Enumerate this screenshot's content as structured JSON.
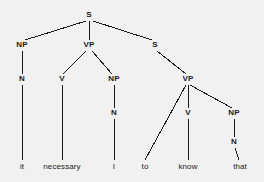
{
  "diagram": {
    "type": "constituency-tree",
    "sentence": "it necessary I to know that",
    "background_color": "#f1f1f1",
    "line_color": "#1a1a1a",
    "text_color": "#1a1a1a",
    "width": 264,
    "height": 182
  },
  "nodes": [
    {
      "id": "s-root",
      "label": "S",
      "x": 89,
      "y": 15,
      "kind": "nonterminal"
    },
    {
      "id": "np-1",
      "label": "NP",
      "x": 22,
      "y": 45,
      "kind": "nonterminal"
    },
    {
      "id": "vp-1",
      "label": "VP",
      "x": 89,
      "y": 45,
      "kind": "nonterminal"
    },
    {
      "id": "s-2",
      "label": "S",
      "x": 155,
      "y": 45,
      "kind": "nonterminal"
    },
    {
      "id": "n-1",
      "label": "N",
      "x": 22,
      "y": 79,
      "kind": "nonterminal"
    },
    {
      "id": "v-1",
      "label": "V",
      "x": 62,
      "y": 79,
      "kind": "nonterminal"
    },
    {
      "id": "np-2",
      "label": "NP",
      "x": 114,
      "y": 79,
      "kind": "nonterminal"
    },
    {
      "id": "vp-2",
      "label": "VP",
      "x": 188,
      "y": 79,
      "kind": "nonterminal"
    },
    {
      "id": "n-2",
      "label": "N",
      "x": 114,
      "y": 113,
      "kind": "nonterminal"
    },
    {
      "id": "v-2",
      "label": "V",
      "x": 188,
      "y": 113,
      "kind": "nonterminal"
    },
    {
      "id": "np-3",
      "label": "NP",
      "x": 234,
      "y": 113,
      "kind": "nonterminal"
    },
    {
      "id": "n-3",
      "label": "N",
      "x": 234,
      "y": 142,
      "kind": "nonterminal"
    }
  ],
  "leaves": [
    {
      "id": "leaf-it",
      "label": "it",
      "x": 22,
      "y": 167
    },
    {
      "id": "leaf-necessary",
      "label": "necessary",
      "x": 62,
      "y": 167
    },
    {
      "id": "leaf-i",
      "label": "I",
      "x": 114,
      "y": 167
    },
    {
      "id": "leaf-to",
      "label": "to",
      "x": 145,
      "y": 167
    },
    {
      "id": "leaf-know",
      "label": "know",
      "x": 188,
      "y": 167
    },
    {
      "id": "leaf-that",
      "label": "that",
      "x": 240,
      "y": 167
    }
  ],
  "edges": [
    {
      "from": "s-root",
      "to": "np-1",
      "x1": 86,
      "y1": 21,
      "x2": 25,
      "y2": 40
    },
    {
      "from": "s-root",
      "to": "vp-1",
      "x1": 89,
      "y1": 21,
      "x2": 89,
      "y2": 40
    },
    {
      "from": "s-root",
      "to": "s-2",
      "x1": 93,
      "y1": 21,
      "x2": 152,
      "y2": 40
    },
    {
      "from": "np-1",
      "to": "n-1",
      "x1": 22,
      "y1": 51,
      "x2": 22,
      "y2": 74
    },
    {
      "from": "vp-1",
      "to": "v-1",
      "x1": 86,
      "y1": 51,
      "x2": 63,
      "y2": 74
    },
    {
      "from": "vp-1",
      "to": "np-2",
      "x1": 92,
      "y1": 51,
      "x2": 112,
      "y2": 74
    },
    {
      "from": "s-2",
      "to": "vp-2",
      "x1": 157,
      "y1": 51,
      "x2": 186,
      "y2": 74
    },
    {
      "from": "n-1",
      "to": "leaf-it",
      "x1": 22,
      "y1": 85,
      "x2": 22,
      "y2": 160
    },
    {
      "from": "v-1",
      "to": "leaf-necessary",
      "x1": 62,
      "y1": 85,
      "x2": 62,
      "y2": 160
    },
    {
      "from": "np-2",
      "to": "n-2",
      "x1": 114,
      "y1": 85,
      "x2": 114,
      "y2": 108
    },
    {
      "from": "n-2",
      "to": "leaf-i",
      "x1": 114,
      "y1": 119,
      "x2": 114,
      "y2": 160
    },
    {
      "from": "vp-2",
      "to": "leaf-to",
      "x1": 186,
      "y1": 85,
      "x2": 145,
      "y2": 160
    },
    {
      "from": "vp-2",
      "to": "v-2",
      "x1": 188,
      "y1": 85,
      "x2": 188,
      "y2": 108
    },
    {
      "from": "vp-2",
      "to": "np-3",
      "x1": 190,
      "y1": 85,
      "x2": 232,
      "y2": 108
    },
    {
      "from": "v-2",
      "to": "leaf-know",
      "x1": 188,
      "y1": 119,
      "x2": 188,
      "y2": 160
    },
    {
      "from": "np-3",
      "to": "n-3",
      "x1": 234,
      "y1": 119,
      "x2": 234,
      "y2": 137
    },
    {
      "from": "n-3",
      "to": "leaf-that",
      "x1": 235,
      "y1": 148,
      "x2": 239,
      "y2": 160
    }
  ]
}
